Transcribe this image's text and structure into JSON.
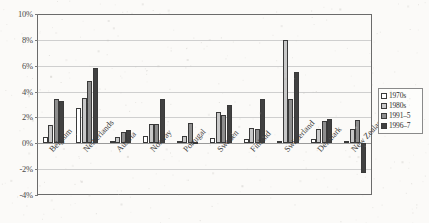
{
  "chart_data": {
    "type": "bar",
    "title": "",
    "subtitle": "",
    "xlabel": "",
    "ylabel": "",
    "ylim": [
      -4,
      10
    ],
    "yticks": [
      "10%",
      "8%",
      "6%",
      "4%",
      "2%",
      "0%",
      "-2%",
      "-4%"
    ],
    "ytick_values": [
      10,
      8,
      6,
      4,
      2,
      0,
      -2,
      -4
    ],
    "grid": true,
    "legend_position": "right",
    "categories": [
      "Belgium",
      "Netherlands",
      "Austria",
      "Norway",
      "Portugal",
      "Sweden",
      "Finland",
      "Switzerland",
      "Denmark",
      "New Zealand"
    ],
    "series": [
      {
        "name": "1970s",
        "color": "#ffffff",
        "values": [
          0.5,
          2.7,
          0.2,
          0.6,
          0.2,
          0.4,
          0.3,
          0.2,
          0.3,
          0.2
        ]
      },
      {
        "name": "1980s",
        "color": "#c8c8c8",
        "values": [
          1.4,
          3.5,
          0.5,
          1.5,
          0.6,
          2.4,
          1.2,
          8.0,
          1.1,
          1.1
        ]
      },
      {
        "name": "1991–5",
        "color": "#8e8e8e",
        "values": [
          3.4,
          4.8,
          0.9,
          1.5,
          1.6,
          2.2,
          1.1,
          3.4,
          1.7,
          1.8
        ]
      },
      {
        "name": "1996–7",
        "color": "#414141",
        "values": [
          3.3,
          5.8,
          1.0,
          3.4,
          0.1,
          3.0,
          3.4,
          5.5,
          1.9,
          -2.3
        ]
      }
    ]
  },
  "legend": {
    "entries": [
      {
        "label": "1970s"
      },
      {
        "label": "1980s"
      },
      {
        "label": "1991–5"
      },
      {
        "label": "1996–7"
      }
    ]
  }
}
